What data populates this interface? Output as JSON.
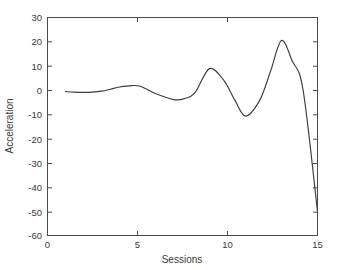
{
  "chart_data": {
    "type": "line",
    "title": "",
    "xlabel": "Sessions",
    "ylabel": "Acceleration",
    "xlim": [
      0,
      15
    ],
    "ylim": [
      -60,
      30
    ],
    "xticks": [
      0,
      5,
      10,
      15
    ],
    "xtick_labels": [
      "0",
      "5",
      "10",
      "15"
    ],
    "yticks": [
      30,
      20,
      10,
      0,
      -10,
      -20,
      -30,
      -40,
      -50,
      -60
    ],
    "ytick_labels": [
      "30",
      "20",
      "10",
      "0",
      "-10",
      "-20",
      "-30",
      "-40",
      "-50",
      "-60"
    ],
    "grid": false,
    "legend": false,
    "legend_position": "none",
    "line_color": "#3c3c3c",
    "axis_color": "#4a4a4a",
    "background_color": "#ffffff",
    "series": [
      {
        "name": "Acceleration",
        "x": [
          1.0,
          1.5,
          2.0,
          2.5,
          3.0,
          3.5,
          4.0,
          4.7,
          5.2,
          6.0,
          7.0,
          7.6,
          8.2,
          9.0,
          9.8,
          10.4,
          11.0,
          11.8,
          12.4,
          13.0,
          13.6,
          14.2,
          15.0
        ],
        "values": [
          -0.6,
          -0.8,
          -0.9,
          -0.8,
          -0.4,
          0.4,
          1.3,
          1.9,
          1.5,
          -1.4,
          -3.9,
          -3.5,
          -1.0,
          8.9,
          4.0,
          -4.0,
          -10.7,
          -4.0,
          8.0,
          20.5,
          12.0,
          0.0,
          -50.0
        ]
      }
    ]
  },
  "axis": {
    "x_title": "Sessions",
    "y_title": "Acceleration"
  }
}
